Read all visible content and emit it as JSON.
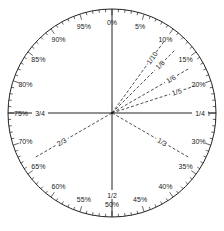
{
  "diagram": {
    "type": "percentage-circle",
    "title": "",
    "colors": {
      "stroke": "#222222",
      "background": "#ffffff",
      "text": "#222222"
    },
    "percent_labels": [
      "0%",
      "5%",
      "10%",
      "15%",
      "20%",
      "25%",
      "30%",
      "35%",
      "40%",
      "45%",
      "50%",
      "55%",
      "60%",
      "65%",
      "70%",
      "75%",
      "80%",
      "85%",
      "90%",
      "95%"
    ],
    "percent_values": [
      0,
      5,
      10,
      15,
      20,
      25,
      30,
      35,
      40,
      45,
      50,
      55,
      60,
      65,
      70,
      75,
      80,
      85,
      90,
      95
    ],
    "solid_lines": [
      {
        "from_pct": 0,
        "to_pct": 50
      },
      {
        "from_pct": 25,
        "to_pct": 75
      }
    ],
    "fraction_lines": [
      {
        "label": "1/10",
        "pct": 10,
        "style": "dashed"
      },
      {
        "label": "1/8",
        "pct": 12.5,
        "style": "dashed"
      },
      {
        "label": "1/6",
        "pct": 16.667,
        "style": "dashed"
      },
      {
        "label": "1/5",
        "pct": 20,
        "style": "dashed"
      },
      {
        "label": "1/3",
        "pct": 33.333,
        "style": "dashed"
      },
      {
        "label": "2/3",
        "pct": 66.667,
        "style": "dashed"
      }
    ],
    "axis_fraction_labels": [
      {
        "label": "1/4",
        "pct": 25
      },
      {
        "label": "1/2",
        "pct": 50
      },
      {
        "label": "3/4",
        "pct": 75
      }
    ],
    "tick_step_pct": 1
  }
}
